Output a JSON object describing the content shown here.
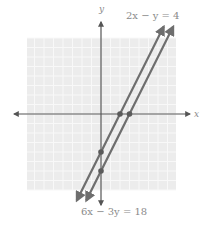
{
  "chart_data": {
    "type": "line",
    "title": "",
    "xlabel": "x",
    "ylabel": "y",
    "grid": true,
    "xlim": [
      -8,
      8
    ],
    "ylim": [
      -8,
      8
    ],
    "unit_px": 9.5,
    "series": [
      {
        "name": "2x − y = 4",
        "equation": "2x - y = 4",
        "slope": 2,
        "y_intercept": -4,
        "x_intercept": 2,
        "points": [
          {
            "x": 0,
            "y": -4
          },
          {
            "x": 2,
            "y": 0
          }
        ],
        "color": "#6e6e6e"
      },
      {
        "name": "6x − 3y = 18",
        "equation": "6x - 3y = 18",
        "slope": 2,
        "y_intercept": -6,
        "x_intercept": 3,
        "points": [
          {
            "x": 0,
            "y": -6
          },
          {
            "x": 3,
            "y": 0
          }
        ],
        "color": "#6e6e6e"
      }
    ],
    "annotations": [
      {
        "text": "2x − y = 4",
        "position": "top-right"
      },
      {
        "text": "6x − 3y = 18",
        "position": "bottom"
      }
    ]
  },
  "labels": {
    "x_axis": "x",
    "y_axis": "y",
    "line1": "2x − y = 4",
    "line2": "6x − 3y = 18"
  },
  "colors": {
    "grid_bg": "#ececec",
    "grid_line": "#f8f8f8",
    "axis": "#555555",
    "line": "#6e6e6e",
    "point": "#5a5a5a",
    "text": "#8a8a8a"
  }
}
